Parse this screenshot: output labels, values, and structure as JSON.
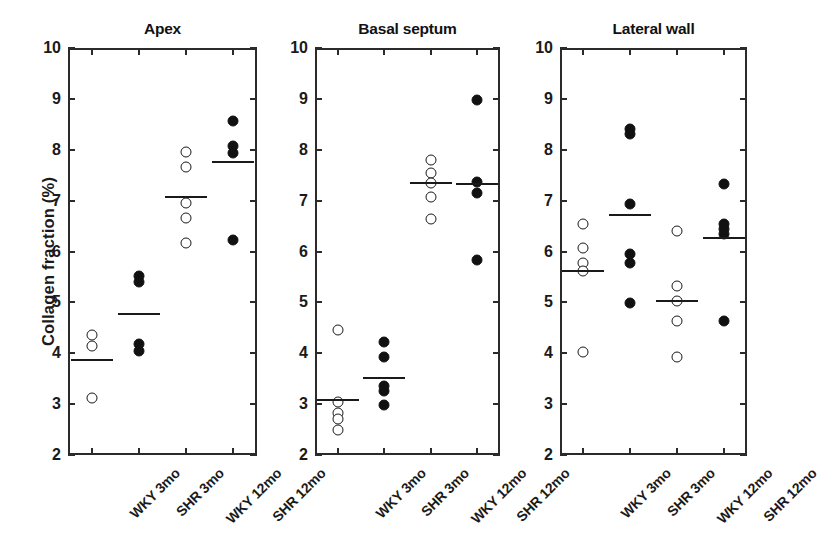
{
  "figure": {
    "ylabel": "Collagen fraction (%)",
    "y_ticks": [
      2,
      3,
      4,
      5,
      6,
      7,
      8,
      9,
      10
    ],
    "y_tick_labels": [
      "2",
      "3",
      "4",
      "5",
      "6",
      "7",
      "8",
      "9",
      "10"
    ],
    "group_labels": [
      "WKY 3mo",
      "SHR 3mo",
      "WKY 12mo",
      "SHR 12mo"
    ],
    "marker_colors": {
      "open": "#ffffff",
      "filled": "#111111",
      "outline": "#1a1a1a",
      "axis": "#2b2b2b"
    }
  },
  "chart_data": {
    "type": "scatter",
    "title": "",
    "xlabel": "",
    "ylabel": "Collagen fraction (%)",
    "ylim": [
      2,
      10
    ],
    "yticks": [
      2,
      3,
      4,
      5,
      6,
      7,
      8,
      9,
      10
    ],
    "grid": false,
    "legend": "none",
    "categories": [
      "WKY 3mo",
      "SHR 3mo",
      "WKY 12mo",
      "SHR 12mo"
    ],
    "marker_styles": [
      "open",
      "filled",
      "open",
      "filled"
    ],
    "panels": [
      {
        "title": "Apex",
        "groups": [
          {
            "label": "WKY 3mo",
            "marker": "open",
            "values": [
              4.35,
              4.15,
              3.12
            ],
            "mean": 3.87
          },
          {
            "label": "SHR 3mo",
            "marker": "filled",
            "values": [
              5.52,
              5.4,
              4.18,
              4.05
            ],
            "mean": 4.78
          },
          {
            "label": "WKY 12mo",
            "marker": "open",
            "values": [
              7.95,
              7.67,
              6.95,
              6.65,
              6.17
            ],
            "mean": 7.08
          },
          {
            "label": "SHR 12mo",
            "marker": "filled",
            "values": [
              8.57,
              8.07,
              7.93,
              6.22
            ],
            "mean": 7.75
          }
        ]
      },
      {
        "title": "Basal septum",
        "groups": [
          {
            "label": "WKY 3mo",
            "marker": "open",
            "values": [
              4.45,
              3.05,
              2.82,
              2.7,
              2.5
            ],
            "mean": 3.08
          },
          {
            "label": "SHR 3mo",
            "marker": "filled",
            "values": [
              4.22,
              3.92,
              3.35,
              3.25,
              2.98
            ],
            "mean": 3.52
          },
          {
            "label": "WKY 12mo",
            "marker": "open",
            "values": [
              7.8,
              7.55,
              7.35,
              7.08,
              6.63
            ],
            "mean": 7.35
          },
          {
            "label": "SHR 12mo",
            "marker": "filled",
            "values": [
              8.97,
              7.37,
              7.15,
              5.83
            ],
            "mean": 7.33
          }
        ]
      },
      {
        "title": "Lateral wall",
        "groups": [
          {
            "label": "WKY 3mo",
            "marker": "open",
            "values": [
              6.55,
              6.07,
              5.78,
              5.62,
              4.02
            ],
            "mean": 5.62
          },
          {
            "label": "SHR 3mo",
            "marker": "filled",
            "values": [
              8.4,
              8.3,
              6.93,
              5.95,
              5.78,
              4.98
            ],
            "mean": 6.71
          },
          {
            "label": "WKY 12mo",
            "marker": "open",
            "values": [
              6.4,
              5.33,
              5.02,
              4.63,
              3.93
            ],
            "mean": 5.03
          },
          {
            "label": "SHR 12mo",
            "marker": "filled",
            "values": [
              7.32,
              6.55,
              6.45,
              6.35,
              4.63
            ],
            "mean": 6.27
          }
        ]
      }
    ],
    "panel_geometry": [
      {
        "left": 68,
        "width": 189
      },
      {
        "left": 315,
        "width": 185
      },
      {
        "left": 560,
        "width": 187
      }
    ]
  }
}
